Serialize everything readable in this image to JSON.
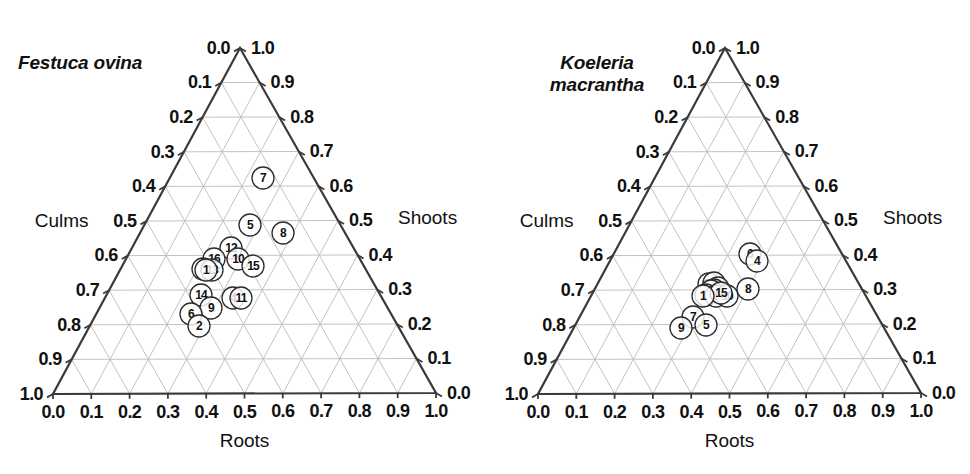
{
  "figure": {
    "background_color": "#ffffff",
    "grid_color": "#c2c2c2",
    "border_color": "#3a3a3a",
    "marker_edge_color": "#2b2b2b",
    "marker_fill_color": "#ffffff"
  },
  "panels": [
    {
      "id": "festuca-ovina",
      "title": "Festuca ovina",
      "title_lines": "Festuca ovina"
    },
    {
      "id": "koeleria-macrantha",
      "title": "Koeleria macrantha",
      "title_lines": "Koeleria\nmacrantha"
    }
  ],
  "axes": {
    "bottom": {
      "name": "Roots",
      "ticks": [
        "0.0",
        "0.1",
        "0.2",
        "0.3",
        "0.4",
        "0.5",
        "0.6",
        "0.7",
        "0.8",
        "0.9",
        "1.0"
      ]
    },
    "left": {
      "name": "Culms",
      "ticks": [
        "0.0",
        "0.1",
        "0.2",
        "0.3",
        "0.4",
        "0.5",
        "0.6",
        "0.7",
        "0.8",
        "0.9",
        "1.0"
      ]
    },
    "right": {
      "name": "Shoots",
      "ticks": [
        "1.0",
        "0.9",
        "0.8",
        "0.7",
        "0.6",
        "0.5",
        "0.4",
        "0.3",
        "0.2",
        "0.1",
        "0.0"
      ]
    }
  },
  "chart_data": {
    "type": "scatter",
    "plot_kind": "ternary",
    "xlabel": "Roots",
    "ylabel": "Culms",
    "zlabel": "Shoots",
    "axis_range": [
      0.0,
      1.0
    ],
    "grid": true,
    "legend": "none",
    "tick_step": 0.1,
    "components": [
      "Roots",
      "Culms",
      "Shoots"
    ],
    "series": [
      {
        "name": "Festuca ovina",
        "panel": "left",
        "points": [
          {
            "label": "1",
            "roots": 0.43,
            "culms": 0.3,
            "shoots": 0.27
          },
          {
            "label": "2",
            "roots": 0.38,
            "culms": 0.41,
            "shoots": 0.21
          },
          {
            "label": "3",
            "roots": 0.41,
            "culms": 0.26,
            "shoots": 0.33
          },
          {
            "label": "4",
            "roots": 0.42,
            "culms": 0.31,
            "shoots": 0.27
          },
          {
            "label": "5",
            "roots": 0.5,
            "culms": 0.05,
            "shoots": 0.45
          },
          {
            "label": "6",
            "roots": 0.37,
            "culms": 0.4,
            "shoots": 0.23
          },
          {
            "label": "7",
            "roots": 0.5,
            "culms": 0.13,
            "shoots": 0.37
          },
          {
            "label": "8",
            "roots": 0.58,
            "culms": 0.06,
            "shoots": 0.36
          },
          {
            "label": "9",
            "roots": 0.39,
            "culms": 0.37,
            "shoots": 0.24
          },
          {
            "label": "10",
            "roots": 0.47,
            "culms": 0.23,
            "shoots": 0.3
          },
          {
            "label": "11",
            "roots": 0.45,
            "culms": 0.3,
            "shoots": 0.25
          },
          {
            "label": "12",
            "roots": 0.46,
            "culms": 0.2,
            "shoots": 0.34
          },
          {
            "label": "13",
            "roots": 0.42,
            "culms": 0.26,
            "shoots": 0.32
          },
          {
            "label": "14",
            "roots": 0.39,
            "culms": 0.33,
            "shoots": 0.28
          },
          {
            "label": "15",
            "roots": 0.49,
            "culms": 0.25,
            "shoots": 0.26
          },
          {
            "label": "16",
            "roots": 0.44,
            "culms": 0.23,
            "shoots": 0.33
          }
        ]
      },
      {
        "name": "Koeleria macrantha",
        "panel": "right",
        "points": [
          {
            "label": "1",
            "roots": 0.45,
            "culms": 0.32,
            "shoots": 0.23
          },
          {
            "label": "2",
            "roots": 0.46,
            "culms": 0.28,
            "shoots": 0.26
          },
          {
            "label": "3",
            "roots": 0.47,
            "culms": 0.29,
            "shoots": 0.24
          },
          {
            "label": "4",
            "roots": 0.58,
            "culms": 0.16,
            "shoots": 0.26
          },
          {
            "label": "5",
            "roots": 0.44,
            "culms": 0.39,
            "shoots": 0.17
          },
          {
            "label": "6",
            "roots": 0.57,
            "culms": 0.15,
            "shoots": 0.28
          },
          {
            "label": "7",
            "roots": 0.42,
            "culms": 0.37,
            "shoots": 0.21
          },
          {
            "label": "8",
            "roots": 0.53,
            "culms": 0.24,
            "shoots": 0.23
          },
          {
            "label": "9",
            "roots": 0.39,
            "culms": 0.4,
            "shoots": 0.21
          },
          {
            "label": "10",
            "roots": 0.5,
            "culms": 0.29,
            "shoots": 0.21
          },
          {
            "label": "11",
            "roots": 0.44,
            "culms": 0.32,
            "shoots": 0.24
          },
          {
            "label": "12",
            "roots": 0.45,
            "culms": 0.27,
            "shoots": 0.28
          },
          {
            "label": "13",
            "roots": 0.47,
            "culms": 0.3,
            "shoots": 0.23
          },
          {
            "label": "14",
            "roots": 0.46,
            "culms": 0.31,
            "shoots": 0.23
          },
          {
            "label": "15",
            "roots": 0.48,
            "culms": 0.3,
            "shoots": 0.22
          },
          {
            "label": "16",
            "roots": 0.46,
            "culms": 0.29,
            "shoots": 0.25
          }
        ]
      }
    ]
  },
  "geometry": {
    "left_panel": {
      "apex_x": 240,
      "apex_y": 48,
      "bl_x": 53,
      "bl_y": 394,
      "br_x": 436,
      "br_y": 393
    },
    "right_panel": {
      "apex_x": 240,
      "apex_y": 48,
      "bl_x": 53,
      "bl_y": 394,
      "br_x": 436,
      "br_y": 393
    },
    "marker_radius": 11
  },
  "pixel_points": {
    "festuca": [
      {
        "label": "12",
        "x": 231,
        "y": 248
      },
      {
        "label": "16",
        "x": 214,
        "y": 259
      },
      {
        "label": "10",
        "x": 238,
        "y": 259
      },
      {
        "label": "15",
        "x": 253,
        "y": 266
      },
      {
        "label": "3",
        "x": 203,
        "y": 269
      },
      {
        "label": "13",
        "x": 212,
        "y": 270
      },
      {
        "label": "1",
        "x": 206,
        "y": 270
      },
      {
        "label": "14",
        "x": 201,
        "y": 295
      },
      {
        "label": "9",
        "x": 211,
        "y": 308
      },
      {
        "label": "4",
        "x": 233,
        "y": 298
      },
      {
        "label": "11",
        "x": 241,
        "y": 298
      },
      {
        "label": "6",
        "x": 191,
        "y": 314
      },
      {
        "label": "2",
        "x": 199,
        "y": 326
      },
      {
        "label": "5",
        "x": 250,
        "y": 225
      },
      {
        "label": "8",
        "x": 283,
        "y": 233
      },
      {
        "label": "7",
        "x": 263,
        "y": 178
      }
    ],
    "koeleria": [
      {
        "label": "6",
        "x": 750,
        "y": 254
      },
      {
        "label": "4",
        "x": 757,
        "y": 261
      },
      {
        "label": "8",
        "x": 748,
        "y": 289
      },
      {
        "label": "12",
        "x": 709,
        "y": 284
      },
      {
        "label": "2",
        "x": 714,
        "y": 283
      },
      {
        "label": "3",
        "x": 718,
        "y": 288
      },
      {
        "label": "16",
        "x": 714,
        "y": 290
      },
      {
        "label": "14",
        "x": 711,
        "y": 291
      },
      {
        "label": "11",
        "x": 706,
        "y": 295
      },
      {
        "label": "13",
        "x": 716,
        "y": 296
      },
      {
        "label": "10",
        "x": 727,
        "y": 296
      },
      {
        "label": "15",
        "x": 721,
        "y": 293
      },
      {
        "label": "1",
        "x": 703,
        "y": 296
      },
      {
        "label": "7",
        "x": 693,
        "y": 317
      },
      {
        "label": "5",
        "x": 706,
        "y": 325
      },
      {
        "label": "9",
        "x": 681,
        "y": 328
      }
    ]
  }
}
